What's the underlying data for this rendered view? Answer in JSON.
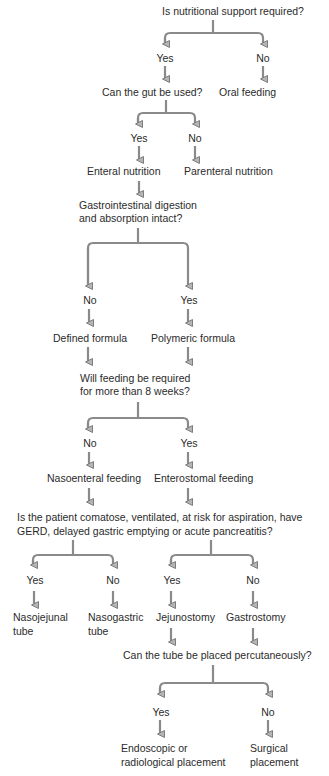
{
  "diagram": {
    "type": "decision-flowchart",
    "colors": {
      "text": "#2b2b2b",
      "connector": "#8a8a8a",
      "background": "#ffffff"
    },
    "nodes": {
      "q1": "Is nutritional support required?",
      "q1_yes": "Yes",
      "q1_no": "No",
      "q2": "Can the gut be used?",
      "oral": "Oral feeding",
      "q2_yes": "Yes",
      "q2_no": "No",
      "enteral": "Enteral nutrition",
      "parenteral": "Parenteral nutrition",
      "q3_line1": "Gastrointestinal digestion",
      "q3_line2": "and absorption intact?",
      "q3_no": "No",
      "q3_yes": "Yes",
      "defined": "Defined formula",
      "polymeric": "Polymeric formula",
      "q4_line1": "Will feeding be required",
      "q4_line2": "for more than 8 weeks?",
      "q4_no": "No",
      "q4_yes": "Yes",
      "nasoenteral": "Nasoenteral feeding",
      "enterostomal": "Enterostomal feeding",
      "q5_line1": "Is the patient comatose, ventilated, at risk for aspiration, have",
      "q5_line2": "GERD, delayed gastric emptying or acute pancreatitis?",
      "q5a_yes": "Yes",
      "q5a_no": "No",
      "q5b_yes": "Yes",
      "q5b_no": "No",
      "nasojejunal_line1": "Nasojejunal",
      "nasojejunal_line2": "tube",
      "nasogastric_line1": "Nasogastric",
      "nasogastric_line2": "tube",
      "jejunostomy": "Jejunostomy",
      "gastrostomy": "Gastrostomy",
      "q6": "Can the tube be placed percutaneously?",
      "q6_yes": "Yes",
      "q6_no": "No",
      "endoscopic_line1": "Endoscopic or",
      "endoscopic_line2": "radiological placement",
      "surgical_line1": "Surgical",
      "surgical_line2": "placement"
    }
  }
}
